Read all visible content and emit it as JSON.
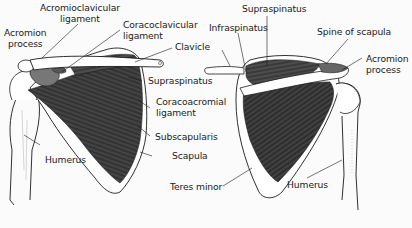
{
  "diagram": {
    "colors": {
      "background": "#fbfbfb",
      "ink": "#1a1a1a",
      "muscle_dark": "#2b2b2b",
      "muscle_mid": "#4a4a4a",
      "bone": "#ffffff"
    },
    "anterior_view": {
      "labels": {
        "acromion_process": [
          "Acromion",
          "process"
        ],
        "acromioclavicular_ligament": [
          "Acromioclavicular",
          "ligament"
        ],
        "coracoclavicular_ligament": [
          "Coracoclavicular",
          "ligament"
        ],
        "clavicle": "Clavicle",
        "supraspinatus": "Supraspinatus",
        "coracoacromial_ligament": [
          "Coracoacromial",
          "ligament"
        ],
        "subscapularis": "Subscapularis",
        "scapula": "Scapula",
        "humerus": "Humerus"
      }
    },
    "posterior_view": {
      "labels": {
        "supraspinatus": "Supraspinatus",
        "infraspinatus": "Infraspinatus",
        "spine_of_scapula": "Spine of scapula",
        "acromion_process": [
          "Acromion",
          "process"
        ],
        "teres_minor": "Teres minor",
        "humerus": "Humerus"
      }
    }
  }
}
